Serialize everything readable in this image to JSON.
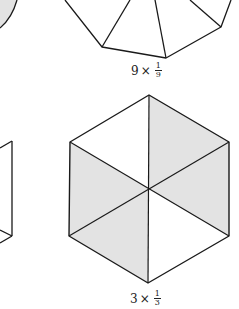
{
  "colors": {
    "stroke": "#1a1a1a",
    "shade": "#e3e3e3",
    "background": "#ffffff"
  },
  "figures": {
    "top_polygon": {
      "label": {
        "count": "9",
        "times": "×",
        "numerator": "1",
        "denominator": "9"
      }
    },
    "hexagon": {
      "label": {
        "count": "3",
        "times": "×",
        "numerator": "1",
        "denominator": "3"
      }
    }
  }
}
